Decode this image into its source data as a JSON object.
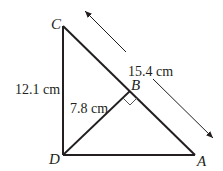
{
  "diagram": {
    "type": "right-triangle-with-altitude",
    "colors": {
      "stroke": "#231f20",
      "right_angle_mark": "#555555",
      "background": "#ffffff"
    },
    "vertices": {
      "C": {
        "label": "C",
        "x": 63,
        "y": 26
      },
      "D": {
        "label": "D",
        "x": 63,
        "y": 155
      },
      "A": {
        "label": "A",
        "x": 195,
        "y": 155
      },
      "B": {
        "label": "B",
        "x": 130,
        "y": 91
      }
    },
    "segments": [
      {
        "from": "C",
        "to": "D",
        "measure": "12.1 cm"
      },
      {
        "from": "D",
        "to": "A",
        "measure": ""
      },
      {
        "from": "C",
        "to": "A",
        "measure": "15.4 cm"
      },
      {
        "from": "D",
        "to": "B",
        "measure": "7.8 cm"
      }
    ],
    "measurements": {
      "CD": "12.1 cm",
      "DB": "7.8 cm",
      "CA": "15.4 cm"
    },
    "annotations": {
      "right_angle_at": "B",
      "dimension_arrow": "CA"
    }
  }
}
